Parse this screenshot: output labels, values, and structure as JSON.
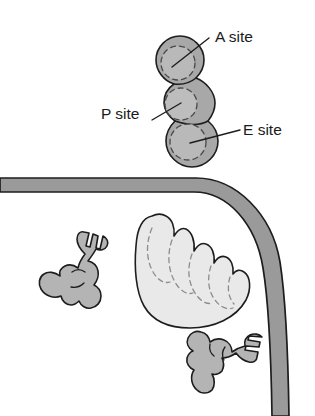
{
  "figure": {
    "background_color": "#ffffff",
    "width": 315,
    "height": 416
  },
  "colors": {
    "ribosome_fill": "#a8a8a8",
    "ribosome_lobe_highlight": "#b8b8b8",
    "outline": "#1d1d1d",
    "membrane_fill": "#9a9a9a",
    "organelle_fill": "#e9e9e9",
    "trna_fill": "#b4b4b4",
    "dashed_stroke": "#4a4a4a",
    "label_text": "#1a1a1a"
  },
  "labels": [
    {
      "id": "a-site",
      "text": "A site",
      "text_x": 215,
      "text_y": 42,
      "leader_from_x": 209,
      "leader_from_y": 38,
      "leader_to_x": 172,
      "leader_to_y": 67,
      "target": "top ribosome lobe"
    },
    {
      "id": "p-site",
      "text": "P site",
      "text_x": 101,
      "text_y": 119,
      "leader_from_x": 152,
      "leader_from_y": 120,
      "leader_to_x": 181,
      "leader_to_y": 103,
      "target": "middle ribosome lobe"
    },
    {
      "id": "e-site",
      "text": "E site",
      "text_x": 243,
      "text_y": 135,
      "leader_from_x": 240,
      "leader_from_y": 130,
      "leader_to_x": 190,
      "leader_to_y": 143,
      "target": "bottom ribosome lobe"
    }
  ],
  "structures": {
    "ribosome": {
      "name": "ribosome",
      "lobes": [
        {
          "site": "A site",
          "cx": 180,
          "cy": 60,
          "r": 24
        },
        {
          "site": "P site",
          "cx": 189,
          "cy": 103,
          "r": 26
        },
        {
          "site": "E site",
          "cx": 192,
          "cy": 141,
          "r": 26
        }
      ]
    },
    "membrane": {
      "name": "organelle membrane",
      "description": "gray band running horizontally from the left edge then curving down the right side to the bottom edge",
      "thickness": 14
    },
    "organelle": {
      "name": "organelle lumen body",
      "description": "light gray rounded body with scalloped upper-right edge and dashed internal cristae-like curves"
    },
    "trna_molecules": [
      {
        "id": "trna-left",
        "name": "tRNA molecule",
        "position": "lower left"
      },
      {
        "id": "trna-bottom",
        "name": "tRNA molecule",
        "position": "bottom right"
      }
    ]
  }
}
